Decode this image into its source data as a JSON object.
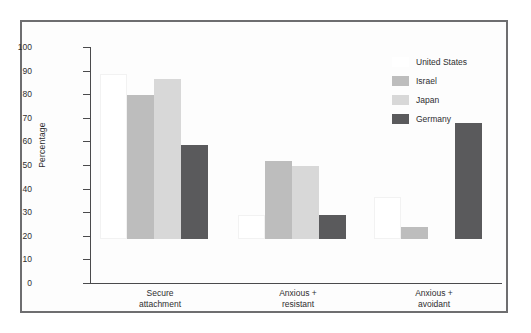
{
  "chart_data": {
    "type": "bar",
    "title": "",
    "xlabel": "",
    "ylabel": "Percentage",
    "ylim": [
      0,
      100
    ],
    "yticks": [
      0,
      10,
      20,
      30,
      40,
      50,
      60,
      70,
      80,
      90,
      100
    ],
    "ytick_labels": [
      "0",
      "10",
      "20",
      "30",
      "40",
      "50",
      "60",
      "70",
      "80",
      "90",
      "100"
    ],
    "grid": false,
    "legend_position": "top-right",
    "categories": [
      "Secure attachment",
      "Anxious + resistant",
      "Anxious + avoidant"
    ],
    "category_lines": [
      [
        "Secure",
        "attachment"
      ],
      [
        "Anxious +",
        "resistant"
      ],
      [
        "Anxious +",
        "avoidant"
      ]
    ],
    "series": [
      {
        "name": "United States",
        "color": "#ffffff",
        "values": [
          70,
          10,
          18
        ]
      },
      {
        "name": "Israel",
        "color": "#bdbdbd",
        "values": [
          61,
          33,
          5
        ]
      },
      {
        "name": "Japan",
        "color": "#d8d8d8",
        "values": [
          68,
          31,
          0
        ]
      },
      {
        "name": "Germany",
        "color": "#5a5a5c",
        "values": [
          40,
          10,
          49
        ]
      }
    ]
  },
  "legend": {
    "items": [
      {
        "label": "United States",
        "swatch": "#ffffff"
      },
      {
        "label": "Israel",
        "swatch": "#bdbdbd"
      },
      {
        "label": "Japan",
        "swatch": "#d8d8d8"
      },
      {
        "label": "Germany",
        "swatch": "#5a5a5c"
      }
    ]
  },
  "axis": {
    "y_title": "Percentage"
  },
  "colors": {
    "frame_border": "#6e6e70",
    "axis": "#4a4a4c",
    "text": "#2e2e30",
    "background": "#fdfdfd"
  }
}
